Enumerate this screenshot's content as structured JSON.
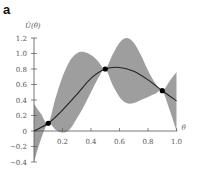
{
  "panel": {
    "label": "a"
  },
  "chart_data": {
    "type": "line",
    "title": "",
    "xlabel": "θ",
    "ylabel": "Ū(θ)",
    "xlim": [
      0,
      1.0
    ],
    "ylim": [
      -0.4,
      1.2
    ],
    "grid": false,
    "legend": null,
    "xticks": [
      "0.2",
      "0.4",
      "0.6",
      "0.8",
      "1.0"
    ],
    "xtick_values": [
      0.2,
      0.4,
      0.6,
      0.8,
      1.0
    ],
    "yticks": [
      "−0.4",
      "−0.2",
      "0",
      "0.2",
      "0.4",
      "0.6",
      "0.8",
      "1.0",
      "1.2"
    ],
    "ytick_values": [
      -0.4,
      -0.2,
      0,
      0.2,
      0.4,
      0.6,
      0.8,
      1.0,
      1.2
    ],
    "series": [
      {
        "name": "mean",
        "kind": "line",
        "color": "#222222",
        "x": [
          0.0,
          0.1,
          0.2,
          0.3,
          0.4,
          0.5,
          0.6,
          0.7,
          0.8,
          0.9,
          1.0
        ],
        "y": [
          0.0,
          0.1,
          0.27,
          0.47,
          0.68,
          0.8,
          0.82,
          0.77,
          0.66,
          0.52,
          0.39
        ]
      },
      {
        "name": "uncertainty band",
        "kind": "area",
        "color": "#999999",
        "x": [
          0.0,
          0.05,
          0.1,
          0.15,
          0.2,
          0.25,
          0.3,
          0.35,
          0.4,
          0.45,
          0.5,
          0.55,
          0.6,
          0.65,
          0.7,
          0.75,
          0.8,
          0.85,
          0.9,
          0.95,
          1.0
        ],
        "upper": [
          0.35,
          0.22,
          0.1,
          0.42,
          0.7,
          0.9,
          1.0,
          1.02,
          0.98,
          0.9,
          0.8,
          0.98,
          1.14,
          1.2,
          1.14,
          0.98,
          0.78,
          0.62,
          0.52,
          0.64,
          0.76
        ],
        "lower": [
          -0.4,
          -0.1,
          0.1,
          0.02,
          -0.02,
          0.02,
          0.16,
          0.32,
          0.5,
          0.68,
          0.8,
          0.6,
          0.44,
          0.36,
          0.36,
          0.4,
          0.44,
          0.48,
          0.52,
          0.28,
          0.0
        ]
      },
      {
        "name": "observations",
        "kind": "scatter",
        "color": "#000000",
        "x": [
          0.1,
          0.5,
          0.9
        ],
        "y": [
          0.1,
          0.8,
          0.52
        ]
      }
    ]
  }
}
